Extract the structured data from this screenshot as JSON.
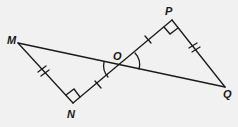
{
  "diagram": {
    "type": "geometry",
    "points": {
      "M": {
        "label": "M",
        "x": 18,
        "y": 43
      },
      "N": {
        "label": "N",
        "x": 73,
        "y": 103
      },
      "O": {
        "label": "O",
        "x": 122,
        "y": 65
      },
      "P": {
        "label": "P",
        "x": 172,
        "y": 20
      },
      "Q": {
        "label": "Q",
        "x": 225,
        "y": 87
      }
    },
    "segments": [
      [
        "M",
        "Q"
      ],
      [
        "N",
        "P"
      ],
      [
        "M",
        "N"
      ],
      [
        "P",
        "Q"
      ]
    ],
    "right_angles": [
      "N",
      "P"
    ],
    "tick_marks": {
      "single": [
        "NO",
        "OP"
      ],
      "double": [
        "MN",
        "PQ"
      ]
    },
    "angle_arcs": [
      "MON",
      "POQ"
    ],
    "stroke_color": "#1a1a1a",
    "background_color": "#f1f1f1"
  }
}
